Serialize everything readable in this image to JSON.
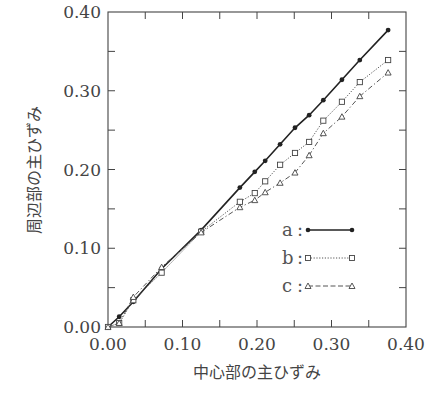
{
  "chart_data": {
    "type": "line",
    "title": "",
    "xlabel": "中心部の主ひずみ",
    "ylabel": "周辺部の主ひずみ",
    "xlim": [
      0.0,
      0.4
    ],
    "ylim": [
      0.0,
      0.4
    ],
    "x_ticks": [
      "0.00",
      "0.10",
      "0.20",
      "0.30",
      "0.40"
    ],
    "y_ticks": [
      "0.00",
      "0.10",
      "0.20",
      "0.30",
      "0.40"
    ],
    "minor_tick_step": 0.05,
    "grid": false,
    "legend_position": "lower right inside",
    "x": [
      0.0,
      0.015,
      0.034,
      0.072,
      0.125,
      0.177,
      0.197,
      0.211,
      0.231,
      0.251,
      0.27,
      0.289,
      0.314,
      0.338,
      0.376
    ],
    "series": [
      {
        "name": "a",
        "marker": "filled-circle",
        "line": "solid",
        "values": [
          0.0,
          0.013,
          0.032,
          0.074,
          0.123,
          0.177,
          0.197,
          0.211,
          0.232,
          0.253,
          0.269,
          0.288,
          0.314,
          0.339,
          0.377
        ]
      },
      {
        "name": "b",
        "marker": "open-square",
        "line": "dotted",
        "values": [
          0.0,
          0.005,
          0.034,
          0.069,
          0.121,
          0.159,
          0.17,
          0.185,
          0.206,
          0.221,
          0.235,
          0.262,
          0.286,
          0.311,
          0.339
        ]
      },
      {
        "name": "c",
        "marker": "open-triangle",
        "line": "dash-dot",
        "values": [
          0.0,
          0.005,
          0.038,
          0.076,
          0.12,
          0.152,
          0.161,
          0.171,
          0.183,
          0.196,
          0.218,
          0.246,
          0.267,
          0.293,
          0.323
        ]
      }
    ]
  },
  "legend": {
    "items": [
      {
        "label": "a",
        "sep": ":"
      },
      {
        "label": "b",
        "sep": ":"
      },
      {
        "label": "c",
        "sep": ":"
      }
    ]
  },
  "colors": {
    "axis": "#444444",
    "series_a": "#222222",
    "series_b": "#555555",
    "series_c": "#555555"
  }
}
